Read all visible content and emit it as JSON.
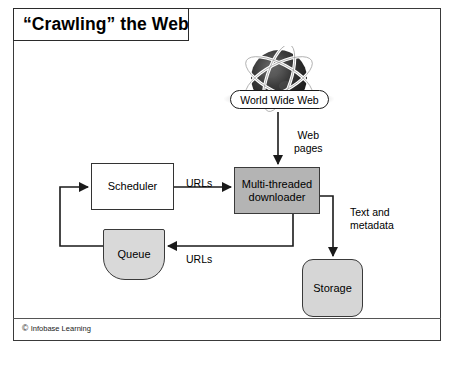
{
  "figure": {
    "title": "“Crawling” the Web",
    "credit_mark": "©",
    "credit": "Infobase Learning"
  },
  "source": {
    "label": "World Wide Web",
    "icon": "globe-icon"
  },
  "nodes": {
    "scheduler": "Scheduler",
    "downloader": "Multi-threaded downloader",
    "queue": "Queue",
    "storage": "Storage"
  },
  "edge_labels": {
    "web_pages": "Web\npages",
    "urls_to_downloader": "URLs",
    "urls_to_queue": "URLs",
    "text_and_metadata": "Text and\nmetadata"
  },
  "colors": {
    "frame_border": "#3a3a3a",
    "downloader_fill": "#b4b4b4",
    "queue_fill": "#d9d9d9",
    "storage_fill": "#d6d6d6",
    "scheduler_fill": "#ffffff",
    "connector": "#1a1a1a",
    "globe_fill": "#2a2a2a",
    "background": "#ffffff"
  }
}
